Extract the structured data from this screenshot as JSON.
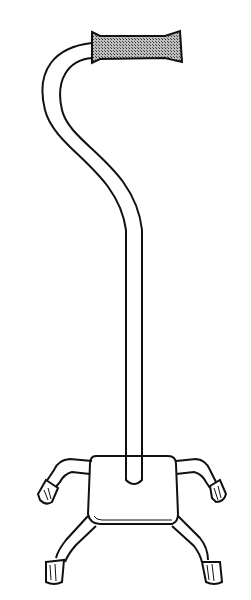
{
  "image": {
    "subject": "quad cane illustration",
    "style": "black line art on white",
    "colors": {
      "background": "#ffffff",
      "stroke": "#111111",
      "grip_fill": "#8a8a8a"
    }
  }
}
